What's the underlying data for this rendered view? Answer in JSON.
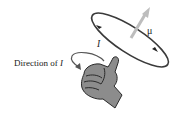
{
  "diagram": {
    "labels": {
      "mu": "μ",
      "current_loop": "I",
      "direction_prefix": "Direction of ",
      "direction_var": "I"
    },
    "colors": {
      "loop": "#3a3a3a",
      "moment_arrow": "#bdbdbd",
      "hand_fill": "#8c8c8c",
      "hand_outline": "#2a2a2a",
      "curved_arrow": "#555555",
      "text": "#222222"
    }
  }
}
